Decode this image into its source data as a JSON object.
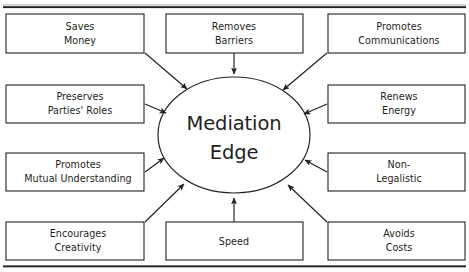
{
  "figure": {
    "hub": {
      "line1": "Mediation",
      "line2": "Edge"
    },
    "colors": {
      "ink": "#231f20",
      "paper": "#ffffff",
      "hairline": "#8a8a8a"
    },
    "rules": {
      "top_visible": true,
      "bottom_visible": true
    },
    "nodes": [
      {
        "id": "saves-money",
        "line1": "Saves",
        "line2": "Money",
        "column": "left",
        "row": "top"
      },
      {
        "id": "removes-barriers",
        "line1": "Removes",
        "line2": "Barriers",
        "column": "center",
        "row": "top"
      },
      {
        "id": "promotes-communications",
        "line1": "Promotes",
        "line2": "Communications",
        "column": "right",
        "row": "top"
      },
      {
        "id": "preserves-parties-roles",
        "line1": "Preserves",
        "line2": "Parties' Roles",
        "column": "left",
        "row": "upper-middle"
      },
      {
        "id": "renews-energy",
        "line1": "Renews",
        "line2": "Energy",
        "column": "right",
        "row": "upper-middle"
      },
      {
        "id": "promotes-mutual-understanding",
        "line1": "Promotes",
        "line2": "Mutual Understanding",
        "column": "left",
        "row": "lower-middle"
      },
      {
        "id": "non-legalistic",
        "line1": "Non-",
        "line2": "Legalistic",
        "column": "right",
        "row": "lower-middle"
      },
      {
        "id": "encourages-creativity",
        "line1": "Encourages",
        "line2": "Creativity",
        "column": "left",
        "row": "bottom"
      },
      {
        "id": "speed",
        "line1": "Speed",
        "line2": "",
        "column": "center",
        "row": "bottom"
      },
      {
        "id": "avoids-costs",
        "line1": "Avoids",
        "line2": "Costs",
        "column": "right",
        "row": "bottom"
      }
    ],
    "arrow_count": 10,
    "arrow_direction": "node-to-hub"
  }
}
